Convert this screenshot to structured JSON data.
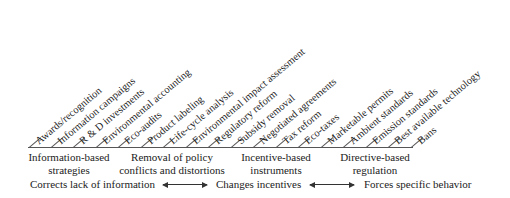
{
  "diagram": {
    "items": [
      "Awards/recognition",
      "Information campaigns",
      "R & D investments",
      "Environmental accounting",
      "Eco-audits",
      "Product labeling",
      "Life-cycle analysis",
      "Environmental impact assessment",
      "Regulatory reform",
      "Subsidy removal",
      "Negotiated agreements",
      "Tax reform",
      "Eco-taxes",
      "Marketable permits",
      "Ambient standards",
      "Emission standards",
      "Best available technology",
      "Bans"
    ],
    "groups": [
      {
        "line1": "Information-based",
        "line2": "strategies"
      },
      {
        "line1": "Removal of policy",
        "line2": "conflicts and distortions"
      },
      {
        "line1": "Incentive-based",
        "line2": "instruments"
      },
      {
        "line1": "Directive-based",
        "line2": "regulation"
      }
    ],
    "effects": [
      "Corrects lack of information",
      "Changes incentives",
      "Forces specific behavior"
    ],
    "colors": {
      "line": "#555555",
      "text": "#222222"
    }
  }
}
